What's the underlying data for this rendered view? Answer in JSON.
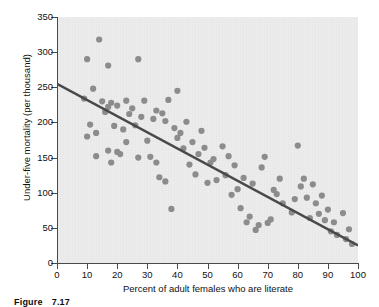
{
  "figure": {
    "caption_label": "Figure",
    "caption_number": "7.17"
  },
  "axes": {
    "x_title": "Percent of adult females who are literate",
    "y_title": "Under-five mortality (per thousand)",
    "x_ticks": [
      "0",
      "10",
      "20",
      "30",
      "40",
      "50",
      "60",
      "70",
      "80",
      "90",
      "100"
    ],
    "y_ticks": [
      "0",
      "50",
      "100",
      "150",
      "200",
      "250",
      "300",
      "350"
    ]
  },
  "style": {
    "point_color": "#8c8c8c",
    "line_color": "#494949",
    "plot_background": "#ededed",
    "axis_color": "#4a4a4a"
  },
  "chart_data": {
    "type": "scatter",
    "title": "",
    "xlabel": "Percent of adult females who are literate",
    "ylabel": "Under-five mortality (per thousand)",
    "xlim": [
      0,
      100
    ],
    "ylim": [
      0,
      350
    ],
    "xticks": [
      0,
      10,
      20,
      30,
      40,
      50,
      60,
      70,
      80,
      90,
      100
    ],
    "yticks": [
      0,
      50,
      100,
      150,
      200,
      250,
      300,
      350
    ],
    "grid": false,
    "legend": "none",
    "marker": "filled-circle",
    "marker_color": "#8c8c8c",
    "points": [
      [
        9,
        234
      ],
      [
        10,
        290
      ],
      [
        10,
        180
      ],
      [
        11,
        197
      ],
      [
        12,
        248
      ],
      [
        13,
        185
      ],
      [
        13,
        152
      ],
      [
        14,
        318
      ],
      [
        15,
        230
      ],
      [
        16,
        215
      ],
      [
        17,
        281
      ],
      [
        17,
        222
      ],
      [
        17,
        160
      ],
      [
        18,
        228
      ],
      [
        18,
        143
      ],
      [
        19,
        195
      ],
      [
        20,
        224
      ],
      [
        20,
        158
      ],
      [
        21,
        155
      ],
      [
        22,
        190
      ],
      [
        23,
        231
      ],
      [
        23,
        172
      ],
      [
        24,
        212
      ],
      [
        25,
        220
      ],
      [
        26,
        196
      ],
      [
        27,
        290
      ],
      [
        27,
        150
      ],
      [
        28,
        208
      ],
      [
        29,
        231
      ],
      [
        30,
        174
      ],
      [
        31,
        151
      ],
      [
        32,
        205
      ],
      [
        33,
        217
      ],
      [
        33,
        143
      ],
      [
        34,
        122
      ],
      [
        35,
        213
      ],
      [
        36,
        202
      ],
      [
        36,
        116
      ],
      [
        37,
        232
      ],
      [
        38,
        77
      ],
      [
        39,
        192
      ],
      [
        40,
        245
      ],
      [
        40,
        178
      ],
      [
        41,
        185
      ],
      [
        42,
        163
      ],
      [
        43,
        201
      ],
      [
        44,
        140
      ],
      [
        45,
        172
      ],
      [
        46,
        126
      ],
      [
        47,
        155
      ],
      [
        48,
        188
      ],
      [
        49,
        164
      ],
      [
        50,
        114
      ],
      [
        51,
        143
      ],
      [
        52,
        148
      ],
      [
        53,
        118
      ],
      [
        55,
        166
      ],
      [
        56,
        125
      ],
      [
        57,
        152
      ],
      [
        58,
        97
      ],
      [
        59,
        139
      ],
      [
        60,
        105
      ],
      [
        61,
        78
      ],
      [
        62,
        121
      ],
      [
        63,
        58
      ],
      [
        64,
        66
      ],
      [
        65,
        113
      ],
      [
        66,
        47
      ],
      [
        67,
        54
      ],
      [
        68,
        136
      ],
      [
        69,
        151
      ],
      [
        70,
        57
      ],
      [
        71,
        62
      ],
      [
        72,
        104
      ],
      [
        73,
        98
      ],
      [
        74,
        120
      ],
      [
        75,
        85
      ],
      [
        78,
        72
      ],
      [
        79,
        91
      ],
      [
        80,
        167
      ],
      [
        81,
        109
      ],
      [
        82,
        120
      ],
      [
        83,
        93
      ],
      [
        84,
        64
      ],
      [
        85,
        112
      ],
      [
        86,
        85
      ],
      [
        87,
        70
      ],
      [
        88,
        96
      ],
      [
        89,
        61
      ],
      [
        90,
        76
      ],
      [
        91,
        45
      ],
      [
        92,
        58
      ],
      [
        93,
        40
      ],
      [
        95,
        71
      ],
      [
        96,
        34
      ],
      [
        97,
        48
      ],
      [
        98,
        27
      ]
    ],
    "trend_line": {
      "type": "linear",
      "x_start": 0,
      "y_start": 255,
      "x_end": 100,
      "y_end": 25,
      "color": "#494949"
    }
  }
}
